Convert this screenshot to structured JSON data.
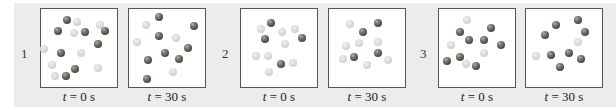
{
  "figure": {
    "panels": [
      {
        "number": "1",
        "boxes": [
          {
            "label_var": "t",
            "label_rest": " = 0 s",
            "spheres": [
              {
                "x": 0.34,
                "y": 0.14,
                "type": "dark"
              },
              {
                "x": 0.48,
                "y": 0.17,
                "type": "light"
              },
              {
                "x": 0.77,
                "y": 0.2,
                "type": "light"
              },
              {
                "x": 0.23,
                "y": 0.28,
                "type": "dark"
              },
              {
                "x": 0.43,
                "y": 0.31,
                "type": "light"
              },
              {
                "x": 0.58,
                "y": 0.29,
                "type": "dark"
              },
              {
                "x": 0.84,
                "y": 0.28,
                "type": "dark"
              },
              {
                "x": 0.75,
                "y": 0.45,
                "type": "dark"
              },
              {
                "x": 0.04,
                "y": 0.51,
                "type": "light"
              },
              {
                "x": 0.26,
                "y": 0.57,
                "type": "dark"
              },
              {
                "x": 0.52,
                "y": 0.57,
                "type": "light"
              },
              {
                "x": 0.14,
                "y": 0.72,
                "type": "light"
              },
              {
                "x": 0.45,
                "y": 0.77,
                "type": "dark"
              },
              {
                "x": 0.75,
                "y": 0.76,
                "type": "light"
              },
              {
                "x": 0.18,
                "y": 0.86,
                "type": "light"
              },
              {
                "x": 0.33,
                "y": 0.86,
                "type": "dark"
              }
            ]
          },
          {
            "label_var": "t",
            "label_rest": " = 30 s",
            "spheres": [
              {
                "x": 0.4,
                "y": 0.1,
                "type": "dark"
              },
              {
                "x": 0.22,
                "y": 0.2,
                "type": "light"
              },
              {
                "x": 0.85,
                "y": 0.22,
                "type": "dark"
              },
              {
                "x": 0.4,
                "y": 0.35,
                "type": "dark"
              },
              {
                "x": 0.62,
                "y": 0.37,
                "type": "light"
              },
              {
                "x": 0.1,
                "y": 0.42,
                "type": "light"
              },
              {
                "x": 0.78,
                "y": 0.5,
                "type": "dark"
              },
              {
                "x": 0.47,
                "y": 0.56,
                "type": "dark"
              },
              {
                "x": 0.25,
                "y": 0.66,
                "type": "dark"
              },
              {
                "x": 0.66,
                "y": 0.64,
                "type": "dark"
              },
              {
                "x": 0.58,
                "y": 0.81,
                "type": "light"
              },
              {
                "x": 0.24,
                "y": 0.9,
                "type": "dark"
              }
            ]
          }
        ]
      },
      {
        "number": "2",
        "boxes": [
          {
            "label_var": "t",
            "label_rest": " = 0 s",
            "spheres": [
              {
                "x": 0.26,
                "y": 0.26,
                "type": "light"
              },
              {
                "x": 0.4,
                "y": 0.18,
                "type": "dark"
              },
              {
                "x": 0.54,
                "y": 0.3,
                "type": "light"
              },
              {
                "x": 0.71,
                "y": 0.26,
                "type": "light"
              },
              {
                "x": 0.31,
                "y": 0.39,
                "type": "dark"
              },
              {
                "x": 0.58,
                "y": 0.45,
                "type": "light"
              },
              {
                "x": 0.8,
                "y": 0.37,
                "type": "dark"
              },
              {
                "x": 0.2,
                "y": 0.6,
                "type": "light"
              },
              {
                "x": 0.36,
                "y": 0.6,
                "type": "light"
              },
              {
                "x": 0.53,
                "y": 0.71,
                "type": "dark"
              },
              {
                "x": 0.69,
                "y": 0.69,
                "type": "light"
              },
              {
                "x": 0.37,
                "y": 0.81,
                "type": "light"
              }
            ]
          },
          {
            "label_var": "t",
            "label_rest": " = 30 s",
            "spheres": [
              {
                "x": 0.28,
                "y": 0.19,
                "type": "light"
              },
              {
                "x": 0.64,
                "y": 0.18,
                "type": "dark"
              },
              {
                "x": 0.45,
                "y": 0.29,
                "type": "dark"
              },
              {
                "x": 0.22,
                "y": 0.48,
                "type": "light"
              },
              {
                "x": 0.4,
                "y": 0.43,
                "type": "light"
              },
              {
                "x": 0.64,
                "y": 0.42,
                "type": "light"
              },
              {
                "x": 0.19,
                "y": 0.64,
                "type": "light"
              },
              {
                "x": 0.33,
                "y": 0.61,
                "type": "dark"
              },
              {
                "x": 0.64,
                "y": 0.57,
                "type": "dark"
              },
              {
                "x": 0.77,
                "y": 0.65,
                "type": "light"
              },
              {
                "x": 0.5,
                "y": 0.72,
                "type": "light"
              }
            ]
          }
        ]
      },
      {
        "number": "3",
        "boxes": [
          {
            "label_var": "t",
            "label_rest": " = 0 s",
            "spheres": [
              {
                "x": 0.37,
                "y": 0.14,
                "type": "light"
              },
              {
                "x": 0.69,
                "y": 0.24,
                "type": "dark"
              },
              {
                "x": 0.28,
                "y": 0.3,
                "type": "dark"
              },
              {
                "x": 0.4,
                "y": 0.4,
                "type": "dark"
              },
              {
                "x": 0.59,
                "y": 0.4,
                "type": "dark"
              },
              {
                "x": 0.81,
                "y": 0.46,
                "type": "dark"
              },
              {
                "x": 0.16,
                "y": 0.46,
                "type": "light"
              },
              {
                "x": 0.59,
                "y": 0.57,
                "type": "light"
              },
              {
                "x": 0.27,
                "y": 0.62,
                "type": "dark"
              },
              {
                "x": 0.1,
                "y": 0.67,
                "type": "dark"
              },
              {
                "x": 0.36,
                "y": 0.71,
                "type": "light"
              },
              {
                "x": 0.49,
                "y": 0.73,
                "type": "dark"
              }
            ]
          },
          {
            "label_var": "t",
            "label_rest": " = 30 s",
            "spheres": [
              {
                "x": 0.69,
                "y": 0.14,
                "type": "dark"
              },
              {
                "x": 0.4,
                "y": 0.21,
                "type": "dark"
              },
              {
                "x": 0.78,
                "y": 0.3,
                "type": "dark"
              },
              {
                "x": 0.25,
                "y": 0.33,
                "type": "dark"
              },
              {
                "x": 0.68,
                "y": 0.42,
                "type": "light"
              },
              {
                "x": 0.13,
                "y": 0.6,
                "type": "light"
              },
              {
                "x": 0.33,
                "y": 0.59,
                "type": "dark"
              },
              {
                "x": 0.56,
                "y": 0.56,
                "type": "dark"
              },
              {
                "x": 0.72,
                "y": 0.64,
                "type": "dark"
              },
              {
                "x": 0.45,
                "y": 0.74,
                "type": "dark"
              }
            ]
          }
        ]
      }
    ]
  },
  "colors": {
    "background_band": "#ececec",
    "box_border": "#555555",
    "dark_sphere": "#5f6a5b",
    "light_sphere": "#d4d4d4"
  }
}
